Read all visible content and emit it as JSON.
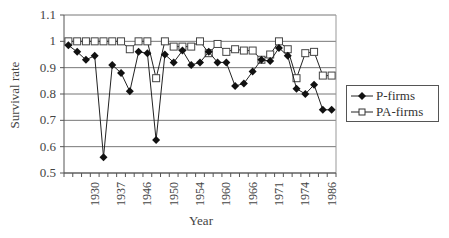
{
  "chart_data": {
    "type": "line",
    "title": "",
    "xlabel": "Year",
    "ylabel": "Survival rate",
    "ylim": [
      0.5,
      1.1
    ],
    "yticks": [
      "0.5",
      "0.6",
      "0.7",
      "0.8",
      "0.9",
      "1",
      "1.1"
    ],
    "grid": "horizontal",
    "legend_position": "right",
    "x_tick_labels": [
      {
        "index": 3,
        "label": "1930"
      },
      {
        "index": 6,
        "label": "1937"
      },
      {
        "index": 9,
        "label": "1946"
      },
      {
        "index": 12,
        "label": "1950"
      },
      {
        "index": 15,
        "label": "1954"
      },
      {
        "index": 18,
        "label": "1960"
      },
      {
        "index": 21,
        "label": "1966"
      },
      {
        "index": 24,
        "label": "1971"
      },
      {
        "index": 27,
        "label": "1974"
      },
      {
        "index": 30,
        "label": "1986"
      }
    ],
    "num_points": 31,
    "series": [
      {
        "name": "P-firms",
        "marker": "diamond-filled",
        "values": [
          0.985,
          0.96,
          0.93,
          0.945,
          0.56,
          0.91,
          0.88,
          0.81,
          0.96,
          0.955,
          0.625,
          0.95,
          0.92,
          0.965,
          0.91,
          0.92,
          0.96,
          0.92,
          0.92,
          0.83,
          0.84,
          0.885,
          0.93,
          0.925,
          0.975,
          0.945,
          0.82,
          0.8,
          0.835,
          0.74,
          0.74
        ]
      },
      {
        "name": "PA-firms",
        "marker": "square-open",
        "values": [
          1.0,
          1.0,
          1.0,
          1.0,
          1.0,
          1.0,
          1.0,
          0.97,
          1.0,
          1.0,
          0.86,
          1.0,
          0.98,
          0.98,
          0.98,
          1.0,
          0.955,
          0.99,
          0.96,
          0.97,
          0.965,
          0.965,
          0.93,
          0.95,
          1.0,
          0.97,
          0.86,
          0.955,
          0.96,
          0.87,
          0.87
        ]
      }
    ]
  },
  "legend": {
    "items": [
      {
        "label": "P-firms"
      },
      {
        "label": "PA-firms"
      }
    ]
  },
  "axes": {
    "x_title": "Year",
    "y_title": "Survival rate"
  }
}
